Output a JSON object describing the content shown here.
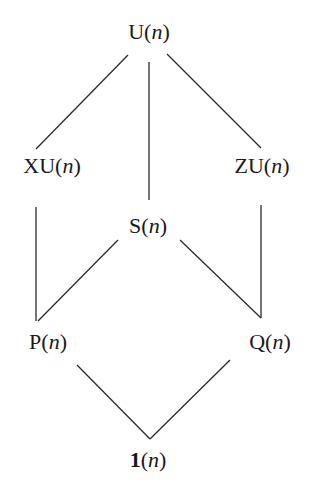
{
  "diagram": {
    "title": "",
    "type": "lattice",
    "line_color": "#2a2a2a",
    "text_color": "#1a1a1a",
    "nodes": [
      {
        "id": "U",
        "prefix": "U",
        "arg": "n",
        "x": 149,
        "y": 32
      },
      {
        "id": "XU",
        "prefix": "XU",
        "arg": "n",
        "x": 52,
        "y": 166
      },
      {
        "id": "ZU",
        "prefix": "ZU",
        "arg": "n",
        "x": 262,
        "y": 166
      },
      {
        "id": "S",
        "prefix": "S",
        "arg": "n",
        "x": 148,
        "y": 226
      },
      {
        "id": "P",
        "prefix": "P",
        "arg": "n",
        "x": 48,
        "y": 342
      },
      {
        "id": "Q",
        "prefix": "Q",
        "arg": "n",
        "x": 270,
        "y": 342
      },
      {
        "id": "1",
        "prefix": "1",
        "arg": "n",
        "x": 148,
        "y": 460,
        "bold_prefix": true
      }
    ],
    "edges": [
      {
        "from": "U",
        "to": "XU",
        "x1": 128,
        "y1": 55,
        "x2": 36,
        "y2": 149
      },
      {
        "from": "U",
        "to": "S",
        "x1": 149,
        "y1": 62,
        "x2": 149,
        "y2": 200
      },
      {
        "from": "U",
        "to": "ZU",
        "x1": 167,
        "y1": 54,
        "x2": 261,
        "y2": 148
      },
      {
        "from": "XU",
        "to": "P",
        "x1": 36,
        "y1": 207,
        "x2": 36,
        "y2": 321
      },
      {
        "from": "S",
        "to": "P",
        "x1": 118,
        "y1": 240,
        "x2": 38,
        "y2": 321
      },
      {
        "from": "S",
        "to": "Q",
        "x1": 180,
        "y1": 240,
        "x2": 261,
        "y2": 318
      },
      {
        "from": "ZU",
        "to": "Q",
        "x1": 261,
        "y1": 205,
        "x2": 261,
        "y2": 318
      },
      {
        "from": "P",
        "to": "1",
        "x1": 77,
        "y1": 365,
        "x2": 150,
        "y2": 439
      },
      {
        "from": "Q",
        "to": "1",
        "x1": 230,
        "y1": 360,
        "x2": 150,
        "y2": 439
      }
    ]
  }
}
